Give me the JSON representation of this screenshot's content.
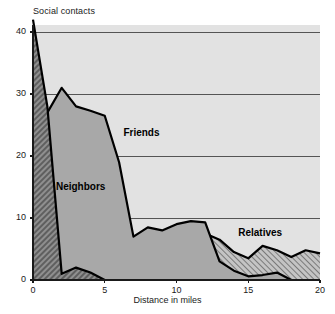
{
  "chart_data": {
    "type": "area",
    "title": "",
    "xlabel": "Distance in miles",
    "ylabel": "Social contacts",
    "xlim": [
      0,
      20
    ],
    "ylim": [
      0,
      42
    ],
    "xticks": [
      0,
      5,
      10,
      15,
      20
    ],
    "yticks": [
      0,
      10,
      20,
      30,
      40
    ],
    "grid": "horizontal",
    "legend_position": "inline-annotations",
    "x": [
      0,
      1,
      2,
      3,
      4,
      5,
      6,
      7,
      8,
      9,
      10,
      11,
      12,
      13,
      14,
      15,
      16,
      17,
      18,
      19,
      20
    ],
    "series": [
      {
        "name": "Neighbors",
        "fill": "#8a8a8a",
        "pattern": "dense-diagonal-hatch",
        "values": [
          42,
          28,
          1,
          2,
          1.2,
          0,
          0,
          0,
          0,
          0,
          0,
          0,
          0,
          0,
          0,
          0,
          0,
          0,
          0,
          0,
          0
        ]
      },
      {
        "name": "Friends",
        "fill": "#a8a8a8",
        "pattern": "solid-gray",
        "values": [
          20,
          27,
          31,
          28,
          27.3,
          26.5,
          19,
          7,
          8.5,
          8,
          9,
          9.5,
          9.3,
          3,
          1.5,
          0.6,
          0.8,
          1.2,
          0,
          0,
          0
        ]
      },
      {
        "name": "Relatives",
        "fill": "#b8b8b8",
        "pattern": "diagonal-hatch",
        "values": [
          2,
          5,
          5,
          4,
          5,
          6,
          5,
          4,
          4,
          5,
          4.8,
          6.8,
          7.5,
          6.5,
          4.5,
          3.5,
          5.5,
          4.8,
          3.7,
          4.8,
          4.3
        ]
      }
    ],
    "annotations": [
      {
        "text": "Friends",
        "x": 6.3,
        "y": 23.5
      },
      {
        "text": "Neighbors",
        "x": 1.6,
        "y": 14.8
      },
      {
        "text": "Relatives",
        "x": 14.3,
        "y": 7.5
      }
    ],
    "colors": {
      "plot_background": "#e2e2e2",
      "gridline": "#555555",
      "axis": "#1a1a1a",
      "line": "#000000",
      "text": "#1a1a1a"
    }
  }
}
